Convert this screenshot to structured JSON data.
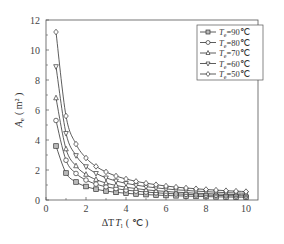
{
  "chart_data": {
    "type": "line",
    "title": "",
    "xlabel": "ΔT_l (℃)",
    "ylabel": "A_e (m²)",
    "xlim": [
      0,
      10.6
    ],
    "ylim": [
      0,
      12
    ],
    "x_ticks": [
      0,
      2,
      4,
      6,
      8,
      10
    ],
    "y_ticks": [
      0,
      2,
      4,
      6,
      8,
      10,
      12
    ],
    "grid": false,
    "legend_position": "upper right",
    "x": [
      0.5,
      1.0,
      1.5,
      2.0,
      2.5,
      3.0,
      3.5,
      4.0,
      4.5,
      5.0,
      5.5,
      6.0,
      6.5,
      7.0,
      7.5,
      8.0,
      8.5,
      9.0,
      9.5,
      10.0
    ],
    "series": [
      {
        "name": "T_e=90℃",
        "marker": "square",
        "values": [
          3.6,
          1.8,
          1.2,
          0.9,
          0.72,
          0.6,
          0.51,
          0.45,
          0.4,
          0.36,
          0.33,
          0.3,
          0.28,
          0.26,
          0.24,
          0.23,
          0.21,
          0.2,
          0.19,
          0.18
        ]
      },
      {
        "name": "T_e=80℃",
        "marker": "circle",
        "values": [
          5.3,
          2.65,
          1.77,
          1.33,
          1.06,
          0.88,
          0.76,
          0.66,
          0.59,
          0.53,
          0.48,
          0.44,
          0.41,
          0.38,
          0.35,
          0.33,
          0.31,
          0.29,
          0.28,
          0.27
        ]
      },
      {
        "name": "T_e=70℃",
        "marker": "triangle-up",
        "values": [
          6.8,
          3.4,
          2.27,
          1.7,
          1.36,
          1.13,
          0.97,
          0.85,
          0.76,
          0.68,
          0.62,
          0.57,
          0.52,
          0.49,
          0.45,
          0.43,
          0.4,
          0.38,
          0.36,
          0.34
        ]
      },
      {
        "name": "T_e=60℃",
        "marker": "triangle-down",
        "values": [
          8.9,
          4.45,
          2.97,
          2.23,
          1.78,
          1.48,
          1.27,
          1.11,
          0.99,
          0.89,
          0.81,
          0.74,
          0.68,
          0.64,
          0.59,
          0.56,
          0.52,
          0.49,
          0.47,
          0.45
        ]
      },
      {
        "name": "T_e=50℃",
        "marker": "diamond",
        "values": [
          11.2,
          5.6,
          3.73,
          2.8,
          2.24,
          1.87,
          1.6,
          1.4,
          1.24,
          1.12,
          1.02,
          0.93,
          0.86,
          0.8,
          0.75,
          0.7,
          0.66,
          0.62,
          0.59,
          0.56
        ]
      }
    ]
  },
  "legend": {
    "items": [
      {
        "label": "T_e=90℃",
        "sub": "e",
        "rest": "=90℃",
        "marker": "square"
      },
      {
        "label": "T_e=80℃",
        "sub": "e",
        "rest": "=80℃",
        "marker": "circle"
      },
      {
        "label": "T_e=70℃",
        "sub": "e",
        "rest": "=70℃",
        "marker": "triangle-up"
      },
      {
        "label": "T_e=60℃",
        "sub": "e",
        "rest": "=60℃",
        "marker": "triangle-down"
      },
      {
        "label": "T_e=50℃",
        "sub": "e",
        "rest": "=50℃",
        "marker": "diamond"
      }
    ]
  },
  "axes": {
    "xlabel_main": "ΔT",
    "xlabel_sub": "l",
    "xlabel_unit": "( ℃ )",
    "ylabel_main": "A",
    "ylabel_sub": "e",
    "ylabel_unit": "( m² )"
  },
  "colors": {
    "line": "#333333",
    "marker_fill": "#ffffff",
    "square_fill": "#bbbbbb",
    "axis": "#555555"
  }
}
